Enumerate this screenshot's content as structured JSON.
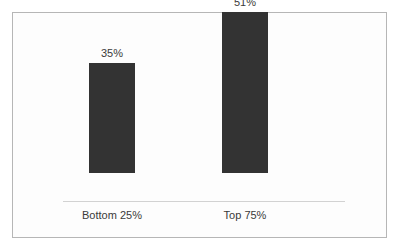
{
  "chart_data": {
    "type": "bar",
    "title": "",
    "subtitle": "",
    "xlabel": "",
    "ylabel": "",
    "categories": [
      "Bottom 25%",
      "Top 75%"
    ],
    "values": [
      35,
      51
    ],
    "value_labels": [
      "35%",
      "51%"
    ],
    "ylim": [
      0,
      60
    ],
    "grid": false,
    "legend": null,
    "legend_position": "none",
    "axis_ticks": [],
    "annotations": [],
    "colors": {
      "bar": "#333333",
      "axis_line": "#d2d2d2",
      "frame_border": "#b6b6b6",
      "background": "#fdfdfd",
      "text": "#3a3a3a"
    }
  }
}
